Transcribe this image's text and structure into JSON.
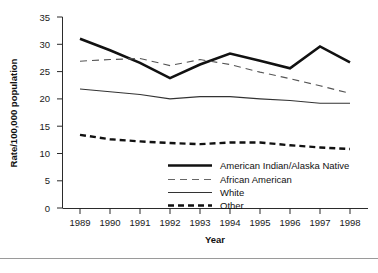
{
  "chart_data": {
    "type": "line",
    "title": "",
    "xlabel": "Year",
    "ylabel": "Rate/100,000 population",
    "categories": [
      "1989",
      "1990",
      "1991",
      "1992",
      "1993",
      "1994",
      "1995",
      "1996",
      "1997",
      "1998"
    ],
    "x": [
      1989,
      1990,
      1991,
      1992,
      1993,
      1994,
      1995,
      1996,
      1997,
      1998
    ],
    "xlim": [
      1989,
      1998
    ],
    "ylim": [
      0,
      35
    ],
    "yticks": [
      0,
      5,
      10,
      15,
      20,
      25,
      30,
      35
    ],
    "ytick_labels": [
      "0",
      "5",
      "10",
      "15",
      "20",
      "25",
      "30",
      "35"
    ],
    "xtick_labels": [
      "1989",
      "1990",
      "1991",
      "1992",
      "1993",
      "1994",
      "1995",
      "1996",
      "1997",
      "1998"
    ],
    "grid": false,
    "legend_position": "inside-lower-right",
    "series": [
      {
        "name": "American Indian/Alaska Native",
        "style": "solid-thick",
        "color": "#111111",
        "values": [
          31.0,
          28.9,
          26.6,
          23.8,
          26.3,
          28.3,
          27.0,
          25.6,
          29.6,
          26.7
        ]
      },
      {
        "name": "African American",
        "style": "dashed-thin-long",
        "color": "#555555",
        "values": [
          26.9,
          27.2,
          27.4,
          26.1,
          27.2,
          26.3,
          24.9,
          23.7,
          22.4,
          21.0
        ]
      },
      {
        "name": "White",
        "style": "solid-thin",
        "color": "#333333",
        "values": [
          21.8,
          21.3,
          20.8,
          20.0,
          20.4,
          20.4,
          20.0,
          19.7,
          19.2,
          19.2
        ]
      },
      {
        "name": "Other",
        "style": "dashed-thick",
        "color": "#111111",
        "values": [
          13.4,
          12.6,
          12.2,
          11.9,
          11.7,
          12.0,
          12.0,
          11.5,
          11.1,
          10.8
        ]
      }
    ]
  },
  "legend": {
    "entries": [
      {
        "label": "American Indian/Alaska Native",
        "swatch": "solid-thick"
      },
      {
        "label": "African American",
        "swatch": "dashed-thin-long"
      },
      {
        "label": "White",
        "swatch": "solid-thin"
      },
      {
        "label": "Other",
        "swatch": "dashed-thick"
      }
    ]
  }
}
